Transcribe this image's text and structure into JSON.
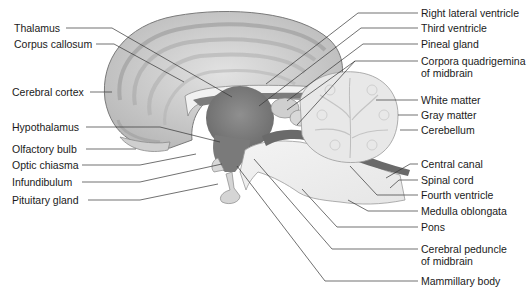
{
  "diagram": {
    "left_labels": [
      {
        "id": "thalamus",
        "text": "Thalamus",
        "x": 14,
        "y": 22
      },
      {
        "id": "corpus-callosum",
        "text": "Corpus callosum",
        "x": 14,
        "y": 38
      },
      {
        "id": "cerebral-cortex",
        "text": "Cerebral cortex",
        "x": 12,
        "y": 86
      },
      {
        "id": "hypothalamus",
        "text": "Hypothalamus",
        "x": 12,
        "y": 121
      },
      {
        "id": "olfactory-bulb",
        "text": "Olfactory bulb",
        "x": 12,
        "y": 143
      },
      {
        "id": "optic-chiasma",
        "text": "Optic chiasma",
        "x": 12,
        "y": 159
      },
      {
        "id": "infundibulum",
        "text": "Infundibulum",
        "x": 12,
        "y": 176
      },
      {
        "id": "pituitary-gland",
        "text": "Pituitary gland",
        "x": 12,
        "y": 194
      }
    ],
    "right_labels": [
      {
        "id": "right-lateral-ventricle",
        "text": "Right lateral ventricle",
        "x": 421,
        "y": 7
      },
      {
        "id": "third-ventricle",
        "text": "Third ventricle",
        "x": 421,
        "y": 22
      },
      {
        "id": "pineal-gland",
        "text": "Pineal gland",
        "x": 421,
        "y": 38
      },
      {
        "id": "corpora-quadrigemina",
        "text": "Corpora quadrigemina",
        "text2": "of midbrain",
        "x": 421,
        "y": 55
      },
      {
        "id": "white-matter",
        "text": "White matter",
        "x": 421,
        "y": 94
      },
      {
        "id": "gray-matter",
        "text": "Gray matter",
        "x": 421,
        "y": 109
      },
      {
        "id": "cerebellum",
        "text": "Cerebellum",
        "x": 421,
        "y": 124
      },
      {
        "id": "central-canal",
        "text": "Central canal",
        "x": 421,
        "y": 158
      },
      {
        "id": "spinal-cord",
        "text": "Spinal cord",
        "x": 421,
        "y": 174
      },
      {
        "id": "fourth-ventricle",
        "text": "Fourth ventricle",
        "x": 421,
        "y": 189
      },
      {
        "id": "medulla-oblongata",
        "text": "Medulla oblongata",
        "x": 421,
        "y": 205
      },
      {
        "id": "pons",
        "text": "Pons",
        "x": 421,
        "y": 221
      },
      {
        "id": "cerebral-peduncle",
        "text": "Cerebral peduncle",
        "text2": "of midbrain",
        "x": 421,
        "y": 243
      },
      {
        "id": "mammillary-body",
        "text": "Mammillary body",
        "x": 421,
        "y": 275
      }
    ]
  }
}
